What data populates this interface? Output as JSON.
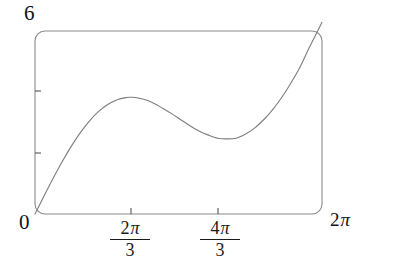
{
  "chart_data": {
    "type": "line",
    "title": "",
    "xlabel": "",
    "ylabel": "",
    "function": "x + 2 sin(x)",
    "xlim": [
      0,
      6.283185
    ],
    "ylim": [
      0,
      6
    ],
    "grid": false,
    "legend": null,
    "frame": {
      "style": "rounded-rectangle-box",
      "left_px": 35,
      "top_px": 31,
      "right_px": 322,
      "bottom_px": 214,
      "corner_radius_px": 10,
      "stroke_color": "#8a8a8a"
    },
    "curve": {
      "stroke_color": "#7d7d7d",
      "stroke_width": 1.1,
      "start_point": {
        "x": 0,
        "y": 0
      },
      "end_point": {
        "x": 6.283185,
        "y": 6.283185
      },
      "local_maximum": {
        "x": 2.094395,
        "y": 4.23
      },
      "local_minimum": {
        "x": 4.18879,
        "y": 2.46
      },
      "x": [
        0.0,
        0.2,
        0.4,
        0.6,
        0.8,
        1.0,
        1.2,
        1.4,
        1.6,
        1.8,
        2.0,
        2.0944,
        2.2,
        2.4,
        2.6,
        2.8,
        3.0,
        3.2,
        3.4,
        3.6,
        3.8,
        4.0,
        4.1888,
        4.4,
        4.6,
        4.8,
        5.0,
        5.2,
        5.4,
        5.6,
        5.8,
        6.0,
        6.2832
      ],
      "y": [
        0.0,
        0.597,
        1.179,
        1.729,
        2.234,
        2.683,
        3.064,
        3.371,
        3.599,
        3.748,
        3.819,
        3.826,
        3.817,
        3.751,
        3.629,
        3.461,
        3.282,
        3.083,
        2.888,
        2.716,
        2.586,
        2.486,
        2.463,
        2.485,
        2.615,
        2.807,
        3.082,
        3.416,
        3.82,
        4.29,
        4.815,
        5.441,
        6.283
      ]
    },
    "y_axis": {
      "ticks": [
        {
          "label": "0",
          "value": 0,
          "position_px": 214,
          "label_shown": true
        },
        {
          "label": "",
          "value": 2,
          "position_px": 153,
          "label_shown": false
        },
        {
          "label": "",
          "value": 4,
          "position_px": 91,
          "label_shown": false
        },
        {
          "label": "6",
          "value": 6,
          "position_px": 31,
          "label_shown": true
        }
      ],
      "max_label": "6",
      "min_label": "0"
    },
    "x_axis": {
      "ticks": [
        {
          "label": "0",
          "value": 0,
          "position_px": 35,
          "label_shown": true,
          "format": "inline"
        },
        {
          "label": "2π/3",
          "numerator": "2π",
          "denominator": "3",
          "value": 2.094395,
          "position_px": 131,
          "label_shown": true,
          "format": "fraction"
        },
        {
          "label": "4π/3",
          "numerator": "4π",
          "denominator": "3",
          "value": 4.18879,
          "position_px": 218,
          "label_shown": true,
          "format": "fraction"
        },
        {
          "label": "2π",
          "value": 6.283185,
          "position_px": 322,
          "label_shown": true,
          "format": "inline"
        }
      ]
    }
  },
  "labels": {
    "y_max": "6",
    "origin": "0",
    "x_max_coefficient": "2",
    "pi_symbol": "π",
    "tick1_numerator_coefficient": "2",
    "tick1_denominator": "3",
    "tick2_numerator_coefficient": "4",
    "tick2_denominator": "3"
  }
}
